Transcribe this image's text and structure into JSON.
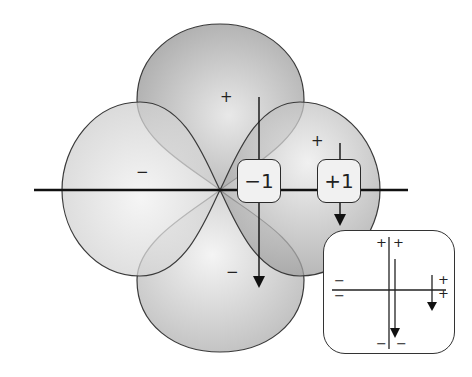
{
  "diagram": {
    "type": "orbital-lobe-diagram",
    "lobes": [
      {
        "position": "top",
        "sign": "+"
      },
      {
        "position": "left",
        "sign": "−"
      },
      {
        "position": "right",
        "sign": "+"
      },
      {
        "position": "bottom",
        "sign": "−"
      }
    ],
    "boxes": [
      {
        "label": "−1"
      },
      {
        "label": "+1"
      }
    ],
    "inset": {
      "signs_top": [
        "+",
        "+"
      ],
      "signs_left": [
        "−",
        "−"
      ],
      "signs_right": [
        "+",
        "+"
      ],
      "signs_bottom": [
        "−",
        "−"
      ]
    },
    "colors": {
      "lobe_dark": "#a9a9a9",
      "lobe_light": "#d9d9d9",
      "outline": "#3a3a3a",
      "axis": "#111111"
    }
  }
}
